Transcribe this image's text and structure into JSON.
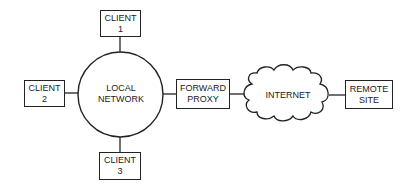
{
  "diagram": {
    "nodes": {
      "client1": {
        "line1": "CLIENT",
        "line2": "1"
      },
      "client2": {
        "line1": "CLIENT",
        "line2": "2"
      },
      "client3": {
        "line1": "CLIENT",
        "line2": "3"
      },
      "local_network": {
        "line1": "LOCAL",
        "line2": "NETWORK"
      },
      "forward_proxy": {
        "line1": "FORWARD",
        "line2": "PROXY"
      },
      "internet": {
        "label": "INTERNET"
      },
      "remote_site": {
        "line1": "REMOTE",
        "line2": "SITE"
      }
    },
    "edges": [
      [
        "client1",
        "local_network"
      ],
      [
        "client2",
        "local_network"
      ],
      [
        "client3",
        "local_network"
      ],
      [
        "local_network",
        "forward_proxy"
      ],
      [
        "forward_proxy",
        "internet"
      ],
      [
        "internet",
        "remote_site"
      ]
    ],
    "colors": {
      "stroke": "#222222",
      "background": "#ffffff"
    }
  }
}
